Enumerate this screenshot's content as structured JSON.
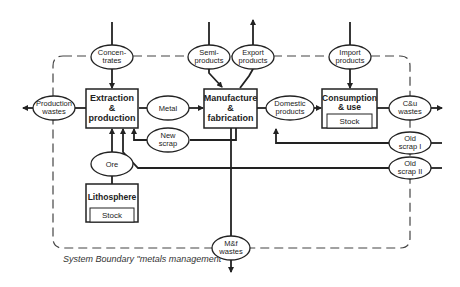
{
  "diagram": {
    "type": "flowchart",
    "colors": {
      "line": "#222222",
      "boundary": "#444444",
      "background": "#ffffff"
    },
    "boundary_caption": "System Boundary \"metals management\"",
    "processes": {
      "extraction": {
        "line1": "Extraction",
        "line2": "&",
        "line3": "production"
      },
      "manufacture": {
        "line1": "Manufacture",
        "line2": "&",
        "line3": "fabrication"
      },
      "consumption": {
        "line1": "Consumption",
        "line2": "& use",
        "stock": "Stock"
      },
      "lithosphere": {
        "line1": "Lithosphere",
        "stock": "Stock"
      }
    },
    "flows": {
      "concentrates": {
        "line1": "Concen-",
        "line2": "trates"
      },
      "semi_products": {
        "line1": "Semi-",
        "line2": "products"
      },
      "export_products": {
        "line1": "Export",
        "line2": "products"
      },
      "import_products": {
        "line1": "Import",
        "line2": "products"
      },
      "production_wastes": {
        "line1": "Production",
        "line2": "wastes"
      },
      "metal": {
        "line1": "Metal"
      },
      "domestic_products": {
        "line1": "Domestic",
        "line2": "products"
      },
      "cu_wastes": {
        "line1": "C&u",
        "line2": "wastes"
      },
      "new_scrap": {
        "line1": "New",
        "line2": "scrap"
      },
      "old_scrap_1": {
        "line1": "Old",
        "line2": "scrap I"
      },
      "old_scrap_2": {
        "line1": "Old",
        "line2": "scrap II"
      },
      "ore": {
        "line1": "Ore"
      },
      "mf_wastes": {
        "line1": "M&f",
        "line2": "wastes"
      }
    }
  }
}
